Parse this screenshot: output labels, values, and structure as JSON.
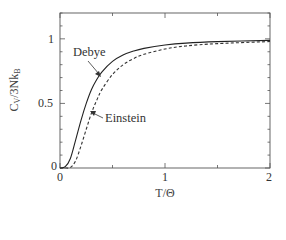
{
  "chart_data": {
    "type": "line",
    "title": "",
    "xlabel": "T/Θ",
    "ylabel": "C_V/3Nk_B",
    "xlim": [
      0,
      2
    ],
    "ylim": [
      0,
      1.2
    ],
    "grid": false,
    "legend": "none (inline annotations with arrows)",
    "x_ticks": [
      "0",
      "1",
      "2"
    ],
    "y_ticks": [
      "0",
      "0.5",
      "1"
    ],
    "series": [
      {
        "name": "Debye",
        "style": "solid",
        "x": [
          0,
          0.05,
          0.1,
          0.15,
          0.2,
          0.25,
          0.3,
          0.35,
          0.4,
          0.5,
          0.6,
          0.7,
          0.8,
          1.0,
          1.2,
          1.5,
          2.0
        ],
        "y": [
          0,
          0.01,
          0.076,
          0.22,
          0.369,
          0.5,
          0.608,
          0.685,
          0.745,
          0.825,
          0.874,
          0.905,
          0.926,
          0.952,
          0.967,
          0.978,
          0.988
        ]
      },
      {
        "name": "Einstein",
        "style": "dashed",
        "x": [
          0,
          0.05,
          0.1,
          0.15,
          0.2,
          0.25,
          0.3,
          0.35,
          0.4,
          0.5,
          0.6,
          0.7,
          0.8,
          1.0,
          1.2,
          1.5,
          2.0
        ],
        "y": [
          0,
          0,
          0.0045,
          0.057,
          0.171,
          0.3,
          0.426,
          0.525,
          0.609,
          0.724,
          0.799,
          0.847,
          0.88,
          0.921,
          0.945,
          0.963,
          0.979
        ]
      }
    ],
    "annotations": [
      {
        "text": "Debye",
        "arrow_to_series": "Debye"
      },
      {
        "text": "Einstein",
        "arrow_to_series": "Einstein"
      }
    ]
  },
  "labels": {
    "xlabel": "T/Θ",
    "ylabel_main": "C",
    "ylabel_sub1": "V",
    "ylabel_mid": "/3Nk",
    "ylabel_sub2": "B",
    "annot_debye": "Debye",
    "annot_einstein": "Einstein",
    "xt0": "0",
    "xt1": "1",
    "xt2": "2",
    "yt0": "0",
    "yt05": "0.5",
    "yt1": "1"
  },
  "colors": {
    "axis": "#555555",
    "debye": "#222222",
    "einstein": "#333333"
  }
}
